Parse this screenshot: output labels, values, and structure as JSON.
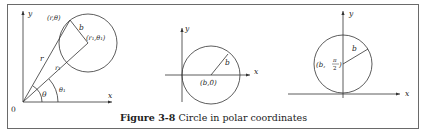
{
  "caption": {
    "figure_number": "Figure 3-8",
    "title": "Circle in polar coordinates"
  },
  "panels": [
    {
      "name": "general-circle",
      "labels": {
        "y_axis": "y",
        "x_axis": "x",
        "origin": "0",
        "point": "(r,θ)",
        "center": "(r₁,θ₁)",
        "radius": "b",
        "r": "r",
        "r1": "r₁",
        "theta": "θ",
        "theta1": "θ₁"
      }
    },
    {
      "name": "circle-on-x-axis",
      "labels": {
        "y_axis": "y",
        "x_axis": "x",
        "radius": "b",
        "center": "(b,0)"
      }
    },
    {
      "name": "circle-on-y-axis",
      "labels": {
        "y_axis": "y",
        "x_axis": "x",
        "radius": "b",
        "center_prefix": "(b,",
        "pi": "π",
        "two": "2",
        "center_suffix": ")"
      }
    }
  ],
  "colors": {
    "stroke": "#333333",
    "frame": "#6a6a6a",
    "text": "#222222"
  }
}
